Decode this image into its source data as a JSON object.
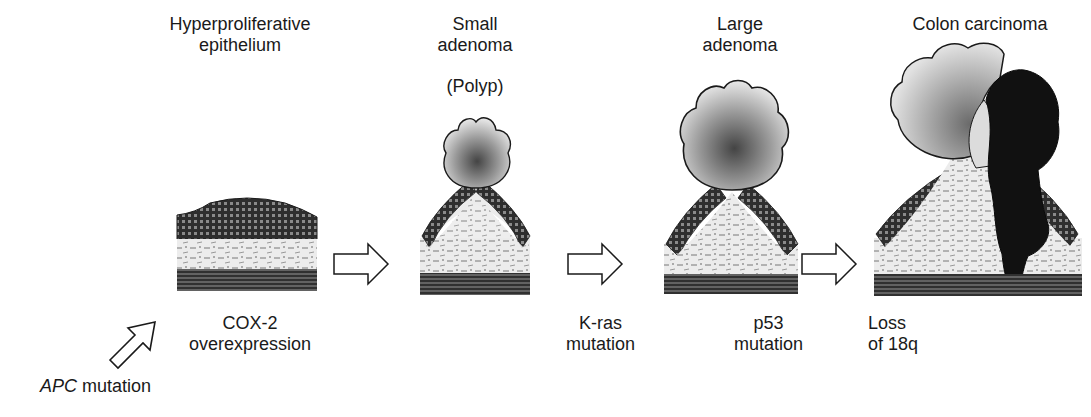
{
  "stages": [
    {
      "id": "hyperproliferative",
      "label_line1": "Hyperproliferative",
      "label_line2": "epithelium"
    },
    {
      "id": "small-adenoma",
      "label_line1": "Small",
      "label_line2": "adenoma",
      "sublabel": "(Polyp)"
    },
    {
      "id": "large-adenoma",
      "label_line1": "Large",
      "label_line2": "adenoma"
    },
    {
      "id": "colon-carcinoma",
      "label_line1": "Colon carcinoma"
    }
  ],
  "events": [
    {
      "id": "apc",
      "italic_part": "APC",
      "rest": " mutation"
    },
    {
      "id": "cox2",
      "line1": "COX-2",
      "line2": "overexpression"
    },
    {
      "id": "kras",
      "line1": "K-ras",
      "line2": "mutation"
    },
    {
      "id": "p53",
      "line1": "p53",
      "line2": "mutation"
    },
    {
      "id": "loss18q",
      "line1": "Loss",
      "line2": "of 18q"
    }
  ],
  "colors": {
    "ink": "#1a1a1a",
    "epithelium_dark": "#2e2e2e",
    "stroma": "#e6e6e6",
    "muscle": "#3a3a3a",
    "adenoma_light": "#cfcfcf",
    "adenoma_core": "#6a6a6a",
    "carcinoma": "#111111"
  }
}
